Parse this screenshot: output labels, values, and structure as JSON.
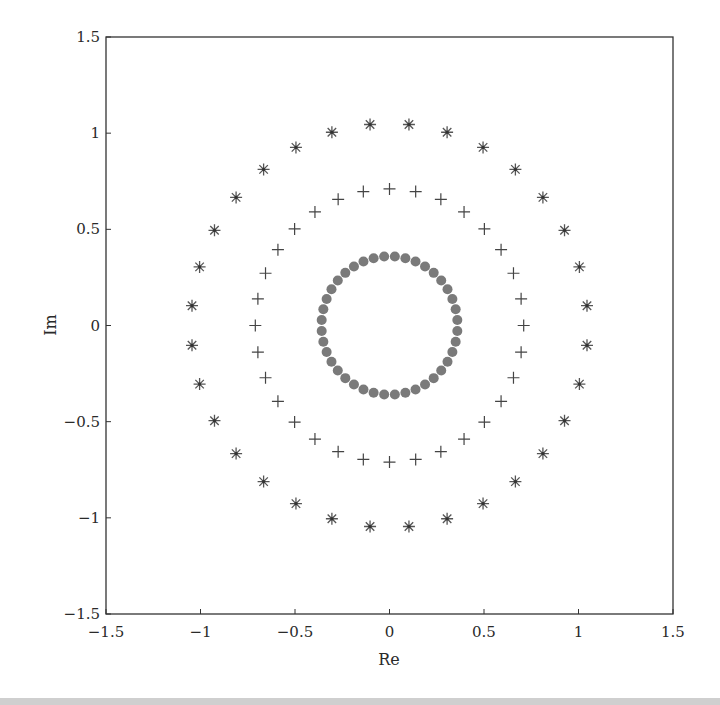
{
  "chart_data": {
    "type": "scatter",
    "title": "",
    "xlabel": "Re",
    "ylabel": "Im",
    "xlim": [
      -1.5,
      1.5
    ],
    "ylim": [
      -1.5,
      1.5
    ],
    "grid": false,
    "legend": null,
    "x_ticks": [
      "-1.5",
      "-1",
      "-0.5",
      "0",
      "0.5",
      "1",
      "1.5"
    ],
    "y_ticks": [
      "-1.5",
      "-1",
      "-0.5",
      "0",
      "0.5",
      "1",
      "1.5"
    ],
    "x_tick_values": [
      -1.5,
      -1,
      -0.5,
      0,
      0.5,
      1,
      1.5
    ],
    "y_tick_values": [
      -1.5,
      -1,
      -0.5,
      0,
      0.5,
      1,
      1.5
    ],
    "series": [
      {
        "name": "outer ring",
        "marker": "asterisk",
        "color": "#555555",
        "shape": "circle",
        "count": 32,
        "radius": 1.05,
        "angle_offset_deg": 5.625
      },
      {
        "name": "middle ring",
        "marker": "plus",
        "color": "#444444",
        "shape": "circle",
        "count": 32,
        "radius": 0.71,
        "angle_offset_deg": 0
      },
      {
        "name": "inner ring",
        "marker": "filled-circle",
        "color": "#7a7a7a",
        "shape": "circle",
        "count": 40,
        "radius": 0.36,
        "angle_offset_deg": 4.5
      }
    ]
  },
  "axes": {
    "xlabel": "Re",
    "ylabel": "Im"
  }
}
